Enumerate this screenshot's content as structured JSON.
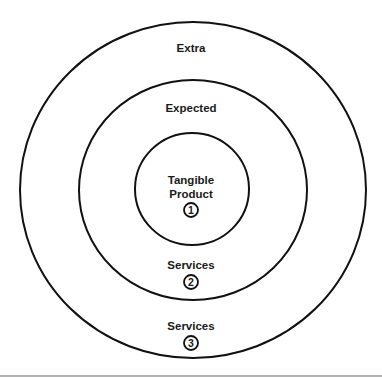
{
  "diagram": {
    "type": "concentric-circles",
    "rings": [
      {
        "level": 1,
        "label": "Tangible Product",
        "line1": "Tangible",
        "line2": "Product",
        "number": "1"
      },
      {
        "level": 2,
        "title": "Expected",
        "label": "Services",
        "number": "2"
      },
      {
        "level": 3,
        "title": "Extra",
        "label": "Services",
        "number": "3"
      }
    ],
    "stroke_color": "#111111",
    "baseline_color": "#9a9a9a"
  }
}
